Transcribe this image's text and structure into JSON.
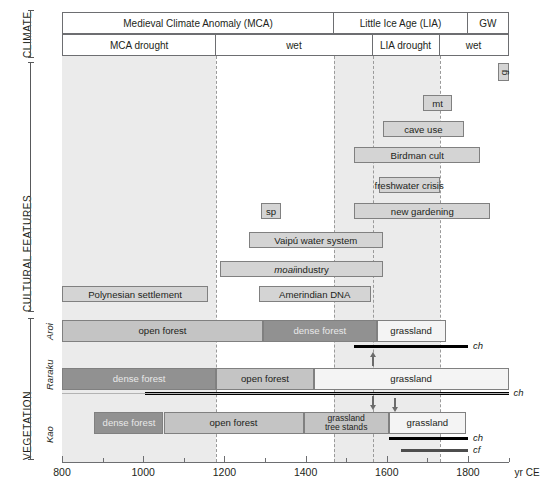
{
  "figure": {
    "axis": {
      "unit_label": "yr CE",
      "min": 800,
      "max": 1900,
      "major_ticks": [
        800,
        1000,
        1200,
        1400,
        1600,
        1800
      ],
      "minor_tick_step": 100,
      "tick_labels": [
        "800",
        "1000",
        "1200",
        "1400",
        "1600",
        "1800"
      ]
    },
    "gridlines_years": [
      1180,
      1470,
      1565,
      1730
    ],
    "shaded_bands": [
      {
        "name": "mca-drought-band",
        "start": 800,
        "end": 1180
      },
      {
        "name": "lia-drought-band",
        "start": 1470,
        "end": 1730
      }
    ],
    "sections": [
      {
        "id": "climate",
        "label": "CLIMATE"
      },
      {
        "id": "cultural",
        "label": "CULTURAL FEATURES"
      },
      {
        "id": "vegetation",
        "label": "VEGETATION"
      }
    ],
    "climate": {
      "row1": [
        {
          "label": "Medieval Climate Anomaly (MCA)",
          "start": 800,
          "end": 1470
        },
        {
          "label": "Little Ice Age (LIA)",
          "start": 1470,
          "end": 1800
        },
        {
          "label": "GW",
          "start": 1800,
          "end": 1900
        }
      ],
      "row2": [
        {
          "label": "MCA drought",
          "start": 800,
          "end": 1180
        },
        {
          "label": "wet",
          "start": 1180,
          "end": 1565
        },
        {
          "label": "LIA drought",
          "start": 1565,
          "end": 1730
        },
        {
          "label": "wet",
          "start": 1730,
          "end": 1900
        }
      ]
    },
    "cultural_features": [
      {
        "label": "g",
        "start": 1875,
        "end": 1900,
        "orientation": "vertical"
      },
      {
        "label": "mt",
        "start": 1690,
        "end": 1760,
        "orientation": "horizontal"
      },
      {
        "label": "cave use",
        "start": 1590,
        "end": 1790,
        "orientation": "horizontal"
      },
      {
        "label": "Birdman cult",
        "start": 1520,
        "end": 1830,
        "orientation": "horizontal"
      },
      {
        "label": "freshwater crisis",
        "start": 1580,
        "end": 1730,
        "orientation": "horizontal"
      },
      {
        "label": "new gardening",
        "start": 1520,
        "end": 1855,
        "orientation": "horizontal"
      },
      {
        "label": "sp",
        "start": 1290,
        "end": 1340,
        "orientation": "horizontal"
      },
      {
        "label": "Vaipú water system",
        "start": 1260,
        "end": 1590,
        "orientation": "horizontal"
      },
      {
        "label": "moai industry",
        "start": 1190,
        "end": 1590,
        "orientation": "horizontal",
        "italic_prefix": "moai",
        "rest": " industry"
      },
      {
        "label": "Polynesian settlement",
        "start": 800,
        "end": 1160,
        "orientation": "horizontal"
      },
      {
        "label": "Amerindian DNA",
        "start": 1285,
        "end": 1560,
        "orientation": "horizontal"
      }
    ],
    "vegetation": {
      "sites": [
        {
          "name": "Aroi",
          "segments": [
            {
              "type": "open forest",
              "label": "open forest",
              "start": 800,
              "end": 1295
            },
            {
              "type": "dense forest",
              "label": "dense forest",
              "start": 1295,
              "end": 1575
            },
            {
              "type": "grassland",
              "label": "grassland",
              "start": 1575,
              "end": 1745
            }
          ],
          "proxies": [
            {
              "code": "ch",
              "label": "ch",
              "start": 1520,
              "end": 1800,
              "color": "#000000"
            }
          ],
          "arrows": [
            {
              "direction": "up",
              "year": 1565
            }
          ]
        },
        {
          "name": "Raraku",
          "segments": [
            {
              "type": "dense forest",
              "label": "dense forest",
              "start": 800,
              "end": 1180
            },
            {
              "type": "open forest",
              "label": "open forest",
              "start": 1180,
              "end": 1420
            },
            {
              "type": "grassland",
              "label": "grassland",
              "start": 1420,
              "end": 1900
            }
          ],
          "proxies": [
            {
              "code": "ch",
              "label": "ch",
              "start": 1005,
              "end": 1900,
              "color": "#000000"
            }
          ],
          "arrows": [
            {
              "direction": "down",
              "year": 1620
            }
          ]
        },
        {
          "name": "Kao",
          "segments": [
            {
              "type": "dense forest",
              "label": "dense forest",
              "start": 880,
              "end": 1050
            },
            {
              "type": "open forest",
              "label": "open forest",
              "start": 1050,
              "end": 1395
            },
            {
              "type": "grassland tree stands",
              "label": "grassland\ntree stands",
              "start": 1395,
              "end": 1605
            },
            {
              "type": "grassland",
              "label": "grassland",
              "start": 1605,
              "end": 1795
            }
          ],
          "proxies": [
            {
              "code": "ch",
              "label": "ch",
              "start": 1605,
              "end": 1800,
              "color": "#000000"
            },
            {
              "code": "cf",
              "label": "cf",
              "start": 1635,
              "end": 1800,
              "color": "#4d4d4d"
            }
          ],
          "arrows": [
            {
              "direction": "down",
              "year": 1565
            }
          ]
        }
      ]
    }
  }
}
